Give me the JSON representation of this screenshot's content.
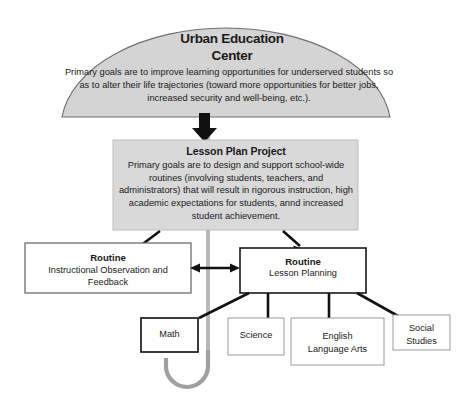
{
  "diagram": {
    "title_alt": "Urban Education Center umbrella diagram",
    "colors": {
      "canopy_fill": "#d4d4d4",
      "canopy_stroke": "#6f6f6f",
      "panel_fill": "#d9d9d9",
      "panel_stroke": "#b3b3b3",
      "box_fill": "#ffffff",
      "box_stroke": "#8a8a8a",
      "box_stroke_strong": "#1a1a1a",
      "arrow": "#1a1a1a",
      "handle": "#9a9a9a",
      "text": "#1a1a1a"
    }
  },
  "canopy": {
    "title": "Urban Education\nCenter",
    "title_line1": "Urban Education",
    "title_line2": "Center",
    "description": "Primary goals are to improve learning opportunities for underserved students so as to alter their life trajectories (toward more opportunities for better jobs, increased security and well-being, etc.)."
  },
  "project_panel": {
    "title": "Lesson Plan Project",
    "description": "Primary goals are to design and support school-wide routines (involving students, teachers, and administrators) that will result in rigorous instruction, high academic expectations for students, annd increased student achievement."
  },
  "routines": [
    {
      "id": "instructional-observation",
      "title": "Routine",
      "description": "Instructional Observation and Feedback"
    },
    {
      "id": "lesson-planning",
      "title": "Routine",
      "description": "Lesson Planning"
    }
  ],
  "subjects": [
    {
      "id": "math",
      "label": "Math",
      "emphasis": "strong"
    },
    {
      "id": "science",
      "label": "Science",
      "emphasis": "normal"
    },
    {
      "id": "english-language-arts",
      "label": "English\nLanguage Arts",
      "emphasis": "normal"
    },
    {
      "id": "social-studies",
      "label": "Social\nStudies",
      "emphasis": "normal"
    }
  ],
  "connectors": {
    "canopy_to_project": "down-arrow",
    "project_to_routine_left": "diagonal-arrow-down-left",
    "project_to_routine_right": "diagonal-arrow-down-right",
    "routine_left_to_right": "double-headed-arrow",
    "routine_right_to_subjects": "fan-connectors"
  }
}
